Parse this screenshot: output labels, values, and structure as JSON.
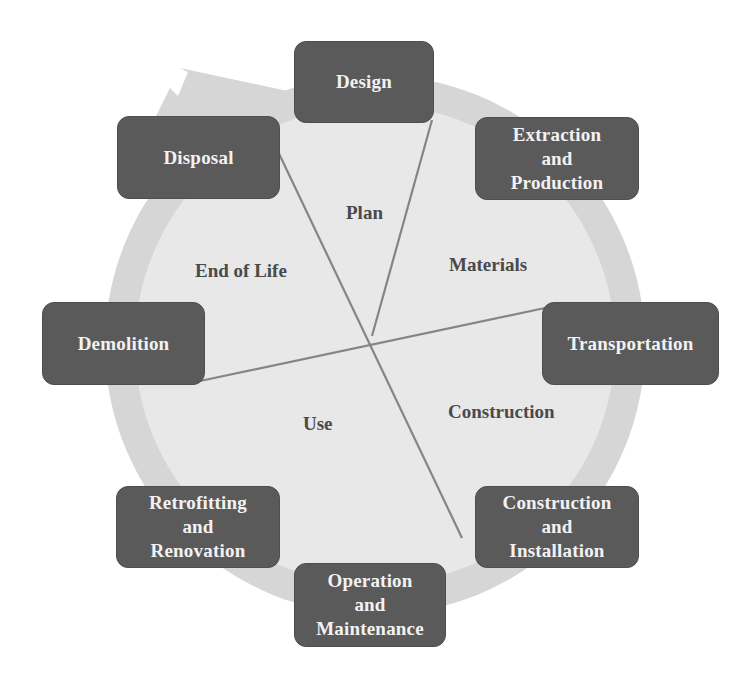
{
  "diagram": {
    "type": "building-life-cycle",
    "colors": {
      "background": "#ffffff",
      "cycle_ring_outer": "#d4d4d4",
      "cycle_ring_inner": "#e6e6e6",
      "box_fill": "#5a5a5a",
      "box_text": "#f2f2f2",
      "divider_line": "#808080",
      "phase_text": "#4a4a4a"
    },
    "stages": [
      {
        "id": "design",
        "lines": [
          "Design"
        ]
      },
      {
        "id": "extraction",
        "lines": [
          "Extraction",
          "and",
          "Production"
        ]
      },
      {
        "id": "transportation",
        "lines": [
          "Transportation"
        ]
      },
      {
        "id": "construction-installation",
        "lines": [
          "Construction",
          "and",
          "Installation"
        ]
      },
      {
        "id": "operation-maintenance",
        "lines": [
          "Operation",
          "and",
          "Maintenance"
        ]
      },
      {
        "id": "retrofitting-renovation",
        "lines": [
          "Retrofitting",
          "and",
          "Renovation"
        ]
      },
      {
        "id": "demolition",
        "lines": [
          "Demolition"
        ]
      },
      {
        "id": "disposal",
        "lines": [
          "Disposal"
        ]
      }
    ],
    "phases": [
      {
        "id": "plan",
        "label": "Plan"
      },
      {
        "id": "materials",
        "label": "Materials"
      },
      {
        "id": "construction",
        "label": "Construction"
      },
      {
        "id": "use",
        "label": "Use"
      },
      {
        "id": "end-of-life",
        "label": "End of Life"
      }
    ]
  }
}
